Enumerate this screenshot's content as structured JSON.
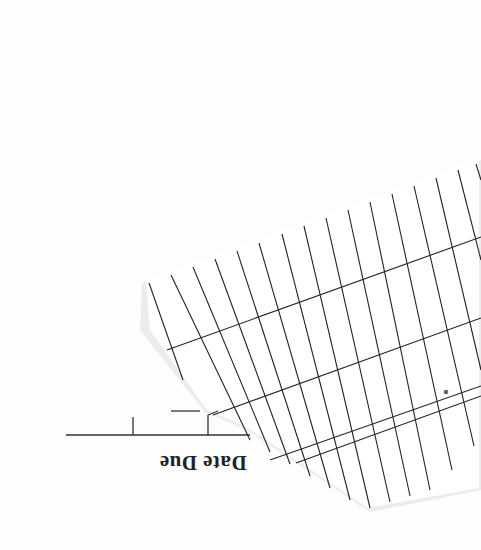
{
  "document": {
    "type": "library date due slip (scanned, upside down)",
    "heading": "Date Due",
    "orientation": "rotated 180 degrees",
    "grid": {
      "vertical_lines": 16,
      "horizontal_lines": 4,
      "entries": []
    }
  },
  "colors": {
    "paper": "#ffffff",
    "background": "#fdfdfd",
    "ink": "#222222",
    "shadow": "#e6e6e6"
  }
}
